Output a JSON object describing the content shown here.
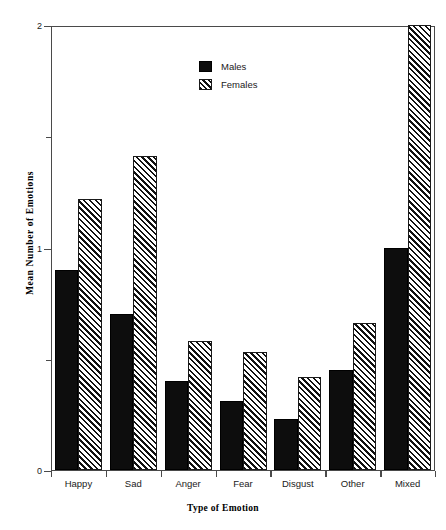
{
  "chart_data": {
    "type": "bar",
    "title": "",
    "xlabel": "Type of Emotion",
    "ylabel": "Mean Number of Emotions",
    "categories": [
      "Happy",
      "Sad",
      "Anger",
      "Fear",
      "Disgust",
      "Other",
      "Mixed"
    ],
    "series": [
      {
        "name": "Males",
        "values": [
          0.9,
          0.7,
          0.4,
          0.31,
          0.23,
          0.45,
          1.0
        ]
      },
      {
        "name": "Females",
        "values": [
          1.22,
          1.41,
          0.58,
          0.53,
          0.42,
          0.66,
          2.0
        ]
      }
    ],
    "ylim": [
      0,
      2
    ],
    "ytick_values": [
      0,
      0.5,
      1,
      1.5,
      2
    ],
    "ytick_labels": [
      "0",
      "",
      "1",
      "",
      "2"
    ],
    "grid": false,
    "legend_position": "upper center",
    "legend": [
      {
        "label": "Males",
        "fill": "solid-black"
      },
      {
        "label": "Females",
        "fill": "diagonal-hatch"
      }
    ]
  },
  "axis": {
    "y_title": "Mean Number of Emotions",
    "x_title": "Type of Emotion",
    "y_labels": {
      "zero": "0",
      "one": "1",
      "two": "2"
    }
  },
  "colors": {
    "males": "#0d0d0d",
    "females_hatch": "#111111",
    "axis": "#4a4a4a",
    "background": "#ffffff"
  }
}
